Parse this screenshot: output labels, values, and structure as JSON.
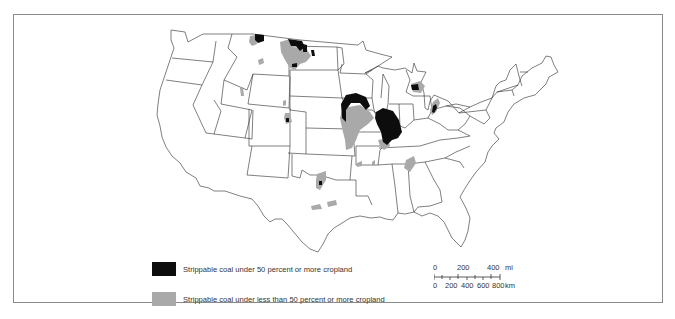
{
  "legend": {
    "items": [
      {
        "swatch": "black",
        "color": "#0d0d0d",
        "label": "Strippable coal under 50 percent or more cropland"
      },
      {
        "swatch": "gray",
        "color": "#a9a9a9",
        "label": "Strippable coal under less than 50 percent or more cropland"
      }
    ]
  },
  "scale_bar": {
    "mi_ticks": [
      "0",
      "200",
      "400"
    ],
    "mi_unit": "mi",
    "km_ticks": [
      "0",
      "200",
      "400",
      "600",
      "800"
    ],
    "km_unit": "km"
  },
  "colors": {
    "border": "#8a8a8a",
    "state_line": "#2a2a2a",
    "coal_high": "#0d0d0d",
    "coal_low": "#a9a9a9"
  },
  "regions": {
    "high_cropland": [
      "Northern Montana",
      "North Dakota",
      "Iowa",
      "Illinois",
      "Michigan",
      "Colorado",
      "Texas",
      "Ohio"
    ],
    "low_cropland": [
      "Montana",
      "North Dakota",
      "Iowa/Missouri",
      "Indiana/Kentucky",
      "Alabama",
      "Texas",
      "Colorado",
      "Michigan",
      "Ohio",
      "Arkansas"
    ]
  }
}
